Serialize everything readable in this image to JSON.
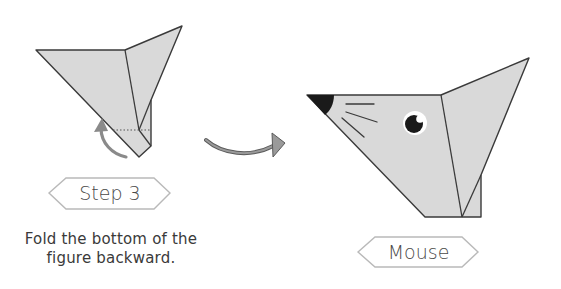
{
  "step": {
    "label": "Step 3",
    "instruction_line1": "Fold the bottom of the",
    "instruction_line2": "figure backward."
  },
  "result": {
    "label": "Mouse"
  },
  "colors": {
    "paper": "#d8d8d8",
    "outline": "#3a3a3a",
    "badge_border": "#b5b5b5",
    "arrow": "#8a8a8a",
    "nose": "#1a1a1a"
  },
  "icons": {
    "fold_arrow": "curved-arrow-backward",
    "transition_arrow": "curved-arrow-right"
  }
}
